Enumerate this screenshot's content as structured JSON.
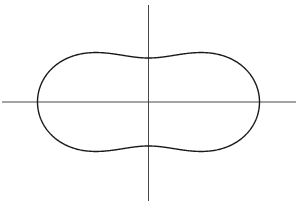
{
  "figure": {
    "type": "cassini-oval",
    "background": "#ffffff",
    "stroke_color": "#1a1a1a",
    "axis_color": "#333333",
    "origin": {
      "x": 148.5,
      "y": 102
    },
    "axes": {
      "horizontal": {
        "x1": 2,
        "x2": 296,
        "y": 102
      },
      "vertical": {
        "x": 148.5,
        "y1": 5,
        "y2": 201
      }
    },
    "curve": {
      "half_width": 111,
      "waist_half_height": 44,
      "lobe_half_height": 61,
      "a_squared": 7128.5,
      "c_squared": 5192.5
    }
  }
}
